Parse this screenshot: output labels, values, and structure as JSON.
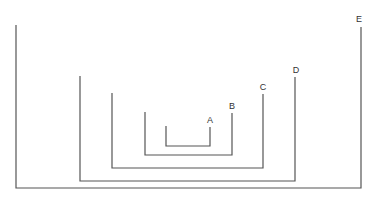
{
  "diagram": {
    "title": "",
    "brackets": [
      {
        "label": "A",
        "left_x": 166,
        "left_top": 126,
        "right_x": 210,
        "right_top": 127,
        "bottom": 146,
        "label_x": 210,
        "label_y": 123
      },
      {
        "label": "B",
        "left_x": 145,
        "left_top": 112,
        "right_x": 232,
        "right_top": 113,
        "bottom": 155,
        "label_x": 232,
        "label_y": 109
      },
      {
        "label": "C",
        "left_x": 112,
        "left_top": 93,
        "right_x": 263,
        "right_top": 94,
        "bottom": 168,
        "label_x": 263,
        "label_y": 90
      },
      {
        "label": "D",
        "left_x": 80,
        "left_top": 76,
        "right_x": 295,
        "right_top": 77,
        "bottom": 181,
        "label_x": 296,
        "label_y": 73
      },
      {
        "label": "E",
        "left_x": 16,
        "left_top": 25,
        "right_x": 361,
        "right_top": 27,
        "bottom": 188,
        "label_x": 359,
        "label_y": 22
      }
    ],
    "stroke_color": "#555555",
    "label_color": "#333333"
  }
}
